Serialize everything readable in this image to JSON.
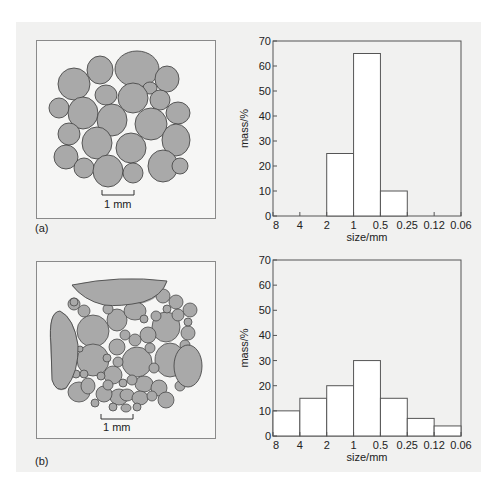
{
  "figure": {
    "panels": [
      {
        "label": "(a)",
        "scale_bar": "1 mm",
        "description": "well-sorted sediment grains"
      },
      {
        "label": "(b)",
        "scale_bar": "1 mm",
        "description": "poorly-sorted sediment grains"
      }
    ]
  },
  "chart_data": [
    {
      "type": "bar",
      "panel": "(a)",
      "title": "",
      "xlabel": "size/mm",
      "ylabel": "mass/%",
      "x_ticks": [
        "8",
        "4",
        "2",
        "1",
        "0.5",
        "0.25",
        "0.12",
        "0.06"
      ],
      "y_ticks": [
        "0",
        "10",
        "20",
        "30",
        "40",
        "50",
        "60",
        "70"
      ],
      "ylim": [
        0,
        70
      ],
      "categories": [
        "8-4",
        "4-2",
        "2-1",
        "1-0.5",
        "0.5-0.25",
        "0.25-0.12",
        "0.12-0.06"
      ],
      "values": [
        0,
        0,
        25,
        65,
        10,
        0,
        0
      ],
      "grid": false,
      "legend": null
    },
    {
      "type": "bar",
      "panel": "(b)",
      "title": "",
      "xlabel": "size/mm",
      "ylabel": "mass/%",
      "x_ticks": [
        "8",
        "4",
        "2",
        "1",
        "0.5",
        "0.25",
        "0.12",
        "0.06"
      ],
      "y_ticks": [
        "0",
        "10",
        "20",
        "30",
        "40",
        "50",
        "60",
        "70"
      ],
      "ylim": [
        0,
        70
      ],
      "categories": [
        "8-4",
        "4-2",
        "2-1",
        "1-0.5",
        "0.5-0.25",
        "0.25-0.12",
        "0.12-0.06"
      ],
      "values": [
        10,
        15,
        20,
        30,
        15,
        7,
        4
      ],
      "grid": false,
      "legend": null
    }
  ],
  "colors": {
    "background": "#f1f1f0",
    "grain_fill": "#a9a9a9",
    "grain_stroke": "#4a4a4a",
    "bar_fill": "#ffffff",
    "axis": "#555555"
  }
}
